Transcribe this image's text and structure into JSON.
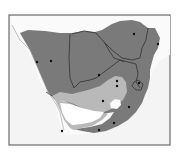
{
  "map": {
    "region": "Southern Africa",
    "legend": [],
    "colors": {
      "background": "#ffffff",
      "ocean": "#f4f4f4",
      "outside_land": "#fafafa",
      "range_dark": "#7a7a7a",
      "range_light": "#b9b9b9",
      "range_none": "#ffffff",
      "border": "#3a3a3a",
      "frame": "#6a6a6a",
      "city_dot": "#111111"
    },
    "cities": [
      {
        "id": "windhoek-area-1",
        "x": 37,
        "y": 62
      },
      {
        "id": "windhoek-area-2",
        "x": 51,
        "y": 61
      },
      {
        "id": "gaborone",
        "x": 99,
        "y": 75
      },
      {
        "id": "harare",
        "x": 134,
        "y": 34
      },
      {
        "id": "mozambique-coast",
        "x": 158,
        "y": 44
      },
      {
        "id": "pretoria",
        "x": 117,
        "y": 81
      },
      {
        "id": "johannesburg",
        "x": 117,
        "y": 86
      },
      {
        "id": "maputo",
        "x": 139,
        "y": 83
      },
      {
        "id": "bloemfontein",
        "x": 103,
        "y": 101
      },
      {
        "id": "durban",
        "x": 129,
        "y": 107
      },
      {
        "id": "east-london",
        "x": 114,
        "y": 123
      },
      {
        "id": "port-elizabeth",
        "x": 99,
        "y": 130
      },
      {
        "id": "cape-town",
        "x": 62,
        "y": 131
      }
    ]
  }
}
